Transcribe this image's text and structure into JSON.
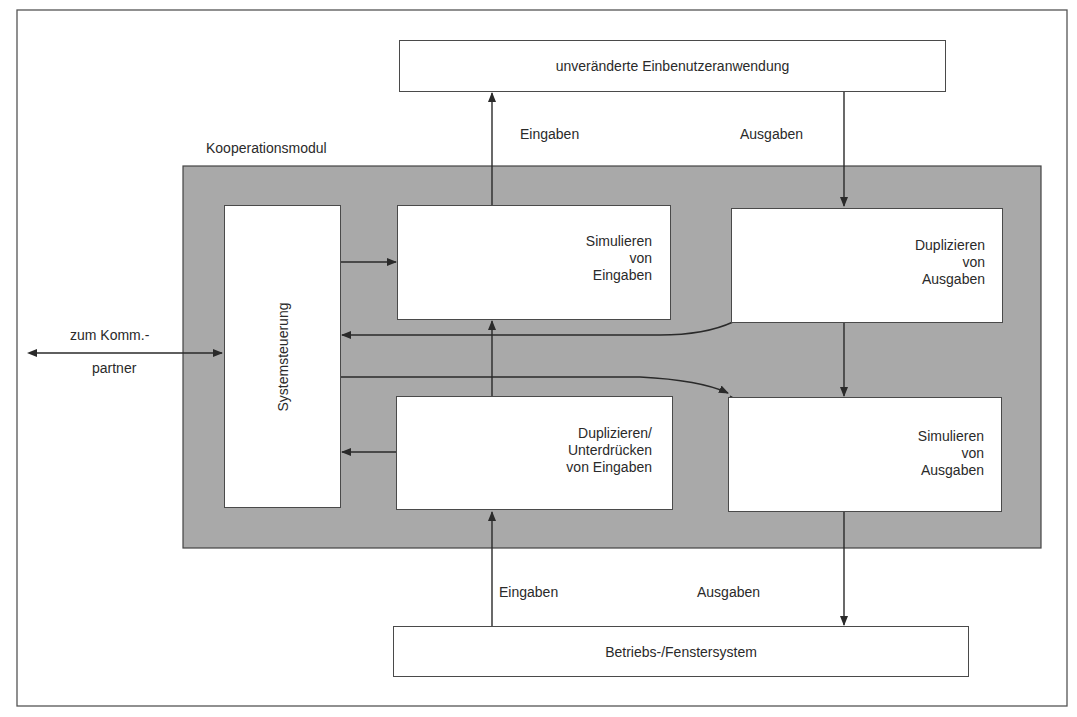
{
  "colors": {
    "module_fill": "#a9a9a9",
    "line": "#2a2a2a",
    "box_fill": "#ffffff"
  },
  "diagram": {
    "top_box": {
      "label": "unveränderte Einbenutzeranwendung"
    },
    "bottom_box": {
      "label": "Betriebs-/Fenstersystem"
    },
    "module": {
      "label": "Kooperationsmodul",
      "system_control": {
        "label": "Systemsteuerung"
      },
      "blocks": [
        {
          "id": "sim-input",
          "lines": [
            "Simulieren",
            "von",
            "Eingaben"
          ]
        },
        {
          "id": "dup-output",
          "lines": [
            "Duplizieren",
            "von",
            "Ausgaben"
          ]
        },
        {
          "id": "dup-suppress-input",
          "lines": [
            "Duplizieren/",
            "Unterdrücken",
            "von Eingaben"
          ]
        },
        {
          "id": "sim-output",
          "lines": [
            "Simulieren",
            "von",
            "Ausgaben"
          ]
        }
      ]
    },
    "flow_labels": {
      "top_inputs": "Eingaben",
      "top_outputs": "Ausgaben",
      "bottom_inputs": "Eingaben",
      "bottom_outputs": "Ausgaben"
    },
    "partner": {
      "line1": "zum Komm.-",
      "line2": "partner"
    }
  }
}
